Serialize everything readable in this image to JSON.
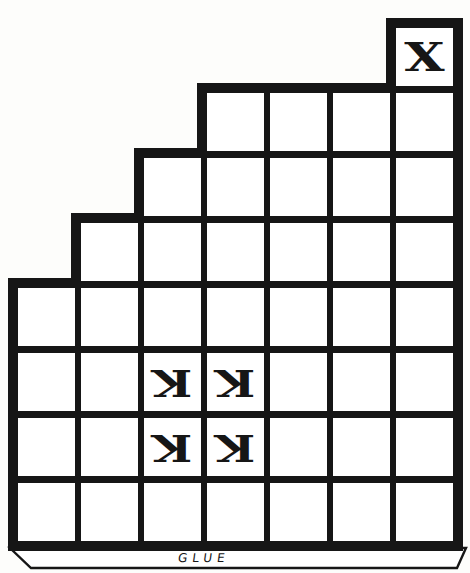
{
  "board": {
    "description": "paper-craft staircase cut-out grid",
    "grid": {
      "rows": 8,
      "cols": 7,
      "row_occupancy": [
        {
          "row": 1,
          "cols": "7"
        },
        {
          "row": 2,
          "cols": "4-7"
        },
        {
          "row": 3,
          "cols": "3-7"
        },
        {
          "row": 4,
          "cols": "2-7"
        },
        {
          "row": 5,
          "cols": "1-7"
        },
        {
          "row": 6,
          "cols": "1-7"
        },
        {
          "row": 7,
          "cols": "1-7"
        },
        {
          "row": 8,
          "cols": "1-7"
        }
      ]
    },
    "marks": {
      "x": "X",
      "k": "K",
      "x_cell": {
        "row": 1,
        "col": 7
      },
      "k_cells": [
        {
          "row": 6,
          "col": 3,
          "rotation_deg": 180
        },
        {
          "row": 6,
          "col": 4,
          "rotation_deg": 180
        },
        {
          "row": 7,
          "col": 3,
          "rotation_deg": 180
        },
        {
          "row": 7,
          "col": 4,
          "rotation_deg": 180
        }
      ]
    },
    "glue_tab": {
      "label": "GLUE"
    },
    "colors": {
      "ink": "#161616",
      "paper": "#ffffff"
    }
  }
}
